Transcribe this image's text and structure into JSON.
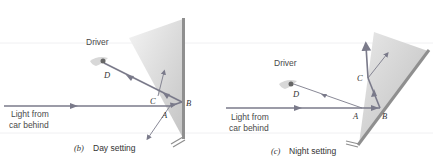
{
  "panels": [
    {
      "id": "b",
      "driver_label": "Driver",
      "light_label_line1": "Light from",
      "light_label_line2": "car behind",
      "points": {
        "A": "A",
        "B": "B",
        "C": "C",
        "D": "D"
      },
      "caption_letter": "(b)",
      "caption_text": "Day setting"
    },
    {
      "id": "c",
      "driver_label": "Driver",
      "light_label_line1": "Light from",
      "light_label_line2": "car behind",
      "points": {
        "A": "A",
        "B": "B",
        "C": "C",
        "D": "D"
      },
      "caption_letter": "(c)",
      "caption_text": "Night setting"
    }
  ],
  "colors": {
    "ray": "#7a7a8a",
    "mirror": "#8f8f8f",
    "prism_light": "#eeeeee",
    "prism_dark": "#c8c8c8",
    "text": "#444444"
  }
}
